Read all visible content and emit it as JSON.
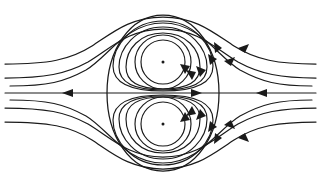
{
  "figure": {
    "width": 321,
    "height": 186,
    "background_color": "#ffffff",
    "line_color": "#1a1a1a"
  },
  "chart_data": {
    "type": "line",
    "subtitle": "",
    "xlabel": "",
    "ylabel": "",
    "xlim": [
      0,
      321
    ],
    "ylim": [
      0,
      186
    ],
    "grid": false,
    "legend": "none",
    "annotations": [],
    "centerline": {
      "name": "horizontal-symmetry-axis",
      "y": 93,
      "x_start": 5,
      "x_end": 316,
      "arrow_markers": [
        {
          "x": 68,
          "y": 93,
          "direction": "left"
        },
        {
          "x": 196,
          "y": 93,
          "direction": "right"
        },
        {
          "x": 262,
          "y": 93,
          "direction": "left"
        }
      ]
    },
    "vortex_centers": [
      {
        "name": "upper-vortex-center",
        "x": 163,
        "y": 62,
        "rotation": "clockwise",
        "dot_radius": 1.5
      },
      {
        "name": "lower-vortex-center",
        "x": 163,
        "y": 124,
        "rotation": "counterclockwise",
        "dot_radius": 1.5
      }
    ],
    "separatrix": {
      "name": "separatrix-oval",
      "cx": 163,
      "cy": 93,
      "rx": 56,
      "ry": 78,
      "closed": true
    },
    "inner_orbits_upper": [
      {
        "cx": 163,
        "cy": 62,
        "rx": 22,
        "ry": 22
      },
      {
        "cx": 163,
        "cy": 62,
        "rx": 28,
        "ry": 27
      }
    ],
    "inner_orbits_lower": [
      {
        "cx": 163,
        "cy": 124,
        "rx": 22,
        "ry": 22
      },
      {
        "cx": 163,
        "cy": 124,
        "rx": 28,
        "ry": 27
      }
    ],
    "mid_orbits_upper": [
      {
        "cx": 163,
        "cy": 63,
        "rx": 38,
        "ry": 35
      },
      {
        "cx": 163,
        "cy": 64,
        "rx": 45,
        "ry": 42
      },
      {
        "cx": 163,
        "cy": 65,
        "rx": 50,
        "ry": 49
      }
    ],
    "mid_orbits_lower": [
      {
        "cx": 163,
        "cy": 123,
        "rx": 38,
        "ry": 35
      },
      {
        "cx": 163,
        "cy": 122,
        "rx": 45,
        "ry": 42
      },
      {
        "cx": 163,
        "cy": 121,
        "rx": 50,
        "ry": 49
      }
    ],
    "outer_streamlines": [
      {
        "name": "outer-upper-1",
        "y_far_left": 64,
        "y_far_right": 64
      },
      {
        "name": "outer-upper-2",
        "y_far_left": 78,
        "y_far_right": 78
      },
      {
        "name": "outer-lower-1",
        "y_far_left": 108,
        "y_far_right": 108
      },
      {
        "name": "outer-lower-2",
        "y_far_left": 122,
        "y_far_right": 122
      }
    ],
    "outer_arrow_markers": [
      {
        "x": 245,
        "y": 46,
        "direction": "up-left",
        "on": "outer-upper-1"
      },
      {
        "x": 229,
        "y": 59,
        "direction": "up-left",
        "on": "outer-upper-2"
      },
      {
        "x": 245,
        "y": 140,
        "direction": "down-left",
        "on": "outer-lower-1"
      },
      {
        "x": 228,
        "y": 128,
        "direction": "down-left",
        "on": "outer-lower-2"
      }
    ],
    "orbit_arrow_markers": [
      {
        "x": 189,
        "y": 67,
        "direction": "down",
        "on": "upper-inner-orbit"
      },
      {
        "x": 204,
        "y": 72,
        "direction": "down",
        "on": "upper-mid-orbit"
      },
      {
        "x": 212,
        "y": 60,
        "direction": "down",
        "on": "upper-outer-orbit"
      },
      {
        "x": 189,
        "y": 119,
        "direction": "up",
        "on": "lower-inner-orbit"
      },
      {
        "x": 202,
        "y": 115,
        "direction": "up",
        "on": "lower-mid-orbit"
      },
      {
        "x": 211,
        "y": 128,
        "direction": "up",
        "on": "lower-outer-orbit"
      }
    ],
    "series": [
      {
        "name": "separatrix",
        "values": []
      },
      {
        "name": "inner-closed-orbits",
        "values": []
      },
      {
        "name": "outer-through-flow",
        "values": []
      },
      {
        "name": "symmetry-axis",
        "values": []
      }
    ]
  }
}
